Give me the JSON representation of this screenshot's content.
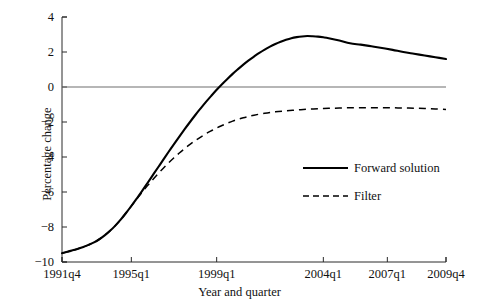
{
  "chart_data": {
    "type": "line",
    "title": "",
    "xlabel": "Year and quarter",
    "ylabel": "Percentage change",
    "ylim": [
      -10,
      4
    ],
    "yticks": [
      4,
      2,
      0,
      -2,
      -4,
      -6,
      -8,
      -10
    ],
    "ytick_labels": [
      "4",
      "2",
      "0",
      "−2",
      "−4",
      "−6",
      "−8",
      "−10"
    ],
    "xtick_labels": [
      "1991q4",
      "1995q1",
      "1999q1",
      "2004q1",
      "2007q1",
      "2009q4"
    ],
    "xtick_positions": [
      0,
      13,
      29,
      49,
      61,
      72
    ],
    "xlim": [
      0,
      72
    ],
    "grid": false,
    "zero_line": true,
    "legend_position": "center-right",
    "series": [
      {
        "name": "Forward solution",
        "style": "solid",
        "color": "#000000",
        "x": [
          0,
          1,
          2,
          3,
          4,
          5,
          6,
          7,
          8,
          9,
          10,
          11,
          12,
          13,
          14,
          15,
          16,
          17,
          18,
          19,
          20,
          21,
          22,
          23,
          24,
          25,
          26,
          27,
          28,
          29,
          30,
          31,
          32,
          33,
          34,
          35,
          36,
          37,
          38,
          39,
          40,
          41,
          42,
          43,
          44,
          45,
          46,
          47,
          48,
          49,
          50,
          52,
          54,
          56,
          58,
          60,
          62,
          64,
          66,
          68,
          70,
          72
        ],
        "values": [
          -9.5,
          -9.42,
          -9.33,
          -9.24,
          -9.14,
          -9.02,
          -8.88,
          -8.7,
          -8.48,
          -8.22,
          -7.92,
          -7.58,
          -7.2,
          -6.8,
          -6.38,
          -5.95,
          -5.5,
          -5.05,
          -4.6,
          -4.15,
          -3.7,
          -3.26,
          -2.83,
          -2.41,
          -2.0,
          -1.6,
          -1.22,
          -0.85,
          -0.5,
          -0.16,
          0.16,
          0.46,
          0.75,
          1.02,
          1.28,
          1.52,
          1.74,
          1.95,
          2.14,
          2.31,
          2.46,
          2.59,
          2.7,
          2.79,
          2.85,
          2.89,
          2.91,
          2.9,
          2.88,
          2.84,
          2.79,
          2.66,
          2.5,
          2.42,
          2.33,
          2.23,
          2.12,
          2.0,
          1.9,
          1.8,
          1.7,
          1.6
        ]
      },
      {
        "name": "Filter",
        "style": "dashed",
        "color": "#000000",
        "x": [
          0,
          1,
          2,
          3,
          4,
          5,
          6,
          7,
          8,
          9,
          10,
          11,
          12,
          13,
          14,
          15,
          16,
          17,
          18,
          19,
          20,
          21,
          22,
          23,
          24,
          25,
          26,
          27,
          28,
          29,
          30,
          31,
          32,
          33,
          34,
          35,
          36,
          38,
          40,
          42,
          44,
          46,
          48,
          50,
          52,
          54,
          56,
          58,
          60,
          62,
          64,
          66,
          68,
          70,
          72
        ],
        "values": [
          -9.5,
          -9.42,
          -9.33,
          -9.24,
          -9.14,
          -9.02,
          -8.88,
          -8.7,
          -8.48,
          -8.22,
          -7.92,
          -7.58,
          -7.2,
          -6.8,
          -6.4,
          -6.02,
          -5.65,
          -5.3,
          -4.96,
          -4.64,
          -4.33,
          -4.04,
          -3.77,
          -3.52,
          -3.28,
          -3.06,
          -2.86,
          -2.67,
          -2.5,
          -2.34,
          -2.2,
          -2.07,
          -1.95,
          -1.85,
          -1.76,
          -1.68,
          -1.61,
          -1.5,
          -1.42,
          -1.36,
          -1.31,
          -1.27,
          -1.24,
          -1.22,
          -1.2,
          -1.19,
          -1.18,
          -1.18,
          -1.18,
          -1.19,
          -1.2,
          -1.21,
          -1.23,
          -1.25,
          -1.28
        ]
      }
    ]
  },
  "legend": {
    "entries": [
      {
        "label": "Forward solution",
        "style": "solid"
      },
      {
        "label": "Filter",
        "style": "dashed"
      }
    ]
  }
}
